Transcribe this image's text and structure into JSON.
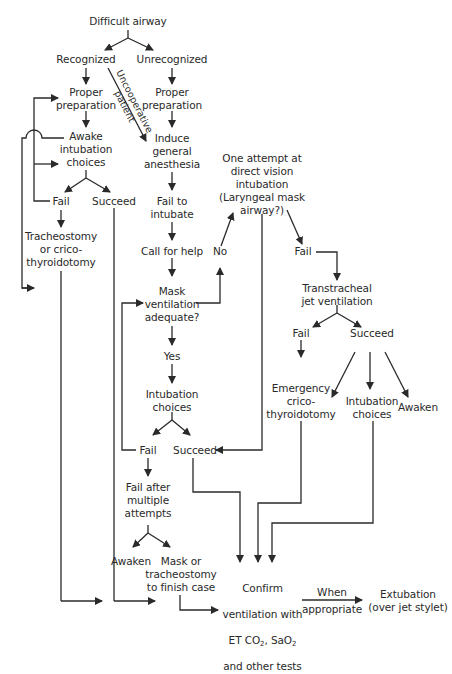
{
  "diagram": {
    "title": "Difficult airway",
    "branches": {
      "recognized": "Recognized",
      "unrecognized": "Unrecognized",
      "uncooperative_patient": "Uncooperative\npatient"
    },
    "left": {
      "proper_preparation": "Proper\npreparation",
      "awake_intubation": "Awake\nintubation\nchoices",
      "fail": "Fail",
      "succeed": "Succeed",
      "tracheostomy": "Tracheostomy\nor crico-\nthyroidotomy"
    },
    "center": {
      "proper_preparation": "Proper\npreparation",
      "induce_anesthesia": "Induce\ngeneral\nanesthesia",
      "fail_to_intubate": "Fail to\nintubate",
      "call_for_help": "Call for help",
      "mask_ventilation": "Mask\nventilation\nadequate?",
      "yes": "Yes",
      "no": "No",
      "intubation_choices": "Intubation\nchoices",
      "fail": "Fail",
      "succeed": "Succeed",
      "fail_after_multiple": "Fail after\nmultiple\nattempts",
      "awaken": "Awaken",
      "mask_or_tracheostomy": "Mask or\ntracheostomy\nto finish case"
    },
    "right": {
      "one_attempt": "One attempt at\ndirect vision\nintubation\n(Laryngeal mask\nairway?)",
      "fail": "Fail",
      "transtracheal": "Transtracheal\njet ventilation",
      "tt_fail": "Fail",
      "tt_succeed": "Succeed",
      "emergency_crico": "Emergency\ncrico-\nthyroidotomy",
      "intubation_choices": "Intubation\nchoices",
      "awaken": "Awaken"
    },
    "bottom": {
      "confirm_line1": "Confirm",
      "confirm_line2": "ventilation with",
      "confirm_et": "ET CO",
      "confirm_sub1": "2",
      "confirm_sao": ", SaO",
      "confirm_sub2": "2",
      "confirm_line4": "and other tests",
      "when": "When",
      "appropriate": "appropriate",
      "extubation": "Extubation\n(over jet stylet)"
    }
  }
}
